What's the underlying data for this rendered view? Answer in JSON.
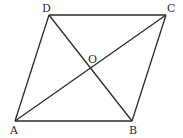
{
  "figure": {
    "type": "parallelogram with diagonals",
    "points": {
      "A": {
        "label": "A",
        "x": 15,
        "y": 121,
        "lx": 10,
        "ly": 134
      },
      "B": {
        "label": "B",
        "x": 132,
        "y": 121,
        "lx": 129,
        "ly": 134
      },
      "C": {
        "label": "C",
        "x": 166,
        "y": 15,
        "lx": 167,
        "ly": 12
      },
      "D": {
        "label": "D",
        "x": 49,
        "y": 15,
        "lx": 42,
        "ly": 12
      },
      "O": {
        "label": "O",
        "x": 91,
        "y": 68,
        "lx": 88,
        "ly": 63
      }
    },
    "sides": [
      "AB",
      "BC",
      "CD",
      "DA"
    ],
    "diagonals": [
      "AC",
      "BD"
    ],
    "colors": {
      "stroke": "#2b2b2b",
      "background": "#ffffff"
    }
  }
}
